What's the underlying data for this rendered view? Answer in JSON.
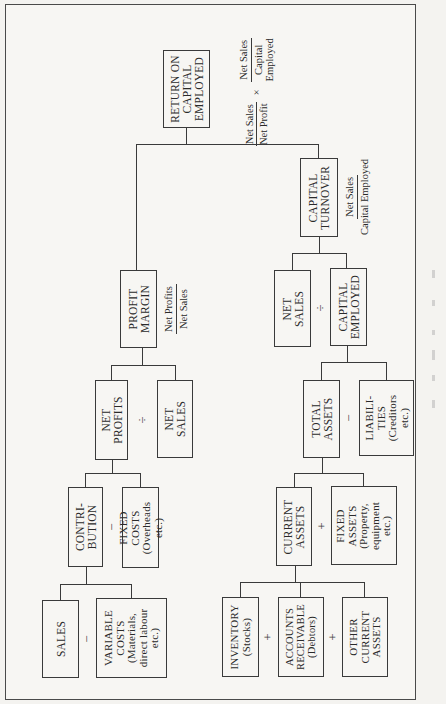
{
  "diagram": {
    "title_box": {
      "label": "RETURN ON\nCAPITAL\nEMPLOYED"
    },
    "roce_formula": {
      "term1": {
        "num": "Net Sales",
        "den": "Net Profit"
      },
      "operator": "×",
      "term2": {
        "num": "Net Sales",
        "den": "Capital\nEmployed"
      }
    },
    "profit_margin": {
      "label": "PROFIT\nMARGIN",
      "formula": {
        "num": "Net Profits",
        "den": "Net Sales"
      }
    },
    "capital_turnover": {
      "label": "CAPITAL\nTURNOVER",
      "formula": {
        "num": "Net Sales",
        "den": "Capital Employed"
      }
    },
    "nodes": {
      "net_profits": "NET\nPROFITS",
      "net_sales_left": "NET\nSALES",
      "net_sales_right": "NET\nSALES",
      "capital_employed": "CAPITAL\nEMPLOYED",
      "contribution": "CONTRI-\nBUTION",
      "fixed_costs": "FIXED\nCOSTS\n(Overheads\netc.)",
      "sales": "SALES",
      "variable_costs": "VARIABLE\nCOSTS\n(Materials,\ndirect labour\netc.)",
      "total_assets": "TOTAL\nASSETS",
      "liabilities": "LIABILI-\nTIES\n(Creditors\netc.)",
      "current_assets": "CURRENT\nASSETS",
      "fixed_assets": "FIXED\nASSETS\n(Property,\nequipment\netc.)",
      "inventory": "INVENTORY\n(Stocks)",
      "accounts_receivable": "ACCOUNTS\nRECEIVABLE\n(Debtors)",
      "other_current_assets": "OTHER\nCURRENT\nASSETS"
    },
    "operators": {
      "net_profits_div_net_sales": "÷",
      "net_sales_div_capital_employed": "÷",
      "contribution_minus_fixed_costs": "−",
      "sales_minus_variable_costs": "−",
      "total_assets_minus_liabilities": "−",
      "current_plus_fixed_assets": "+",
      "inventory_plus_receivables": "+",
      "receivables_plus_other": "+"
    }
  }
}
